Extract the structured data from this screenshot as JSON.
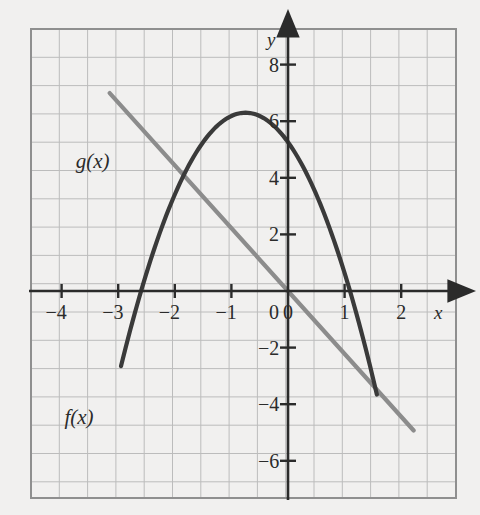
{
  "figure": {
    "background_color": "#f1f0ef",
    "grid_color": "#9a9a9a",
    "grid_minor_color": "#bcbcbc",
    "axis_color": "#2b2b2b",
    "plot_box": {
      "x0": 31,
      "y0": 29,
      "x1": 456,
      "y1": 498,
      "cell_px": 28.3
    }
  },
  "axes": {
    "x_name": "x",
    "y_name": "y",
    "origin_px": {
      "x": 288,
      "y": 291
    },
    "px_per_unit_x": 56.6,
    "px_per_unit_y": 28.3,
    "x_ticks": [
      {
        "value": -4,
        "label": "−4"
      },
      {
        "value": -3,
        "label": "−3"
      },
      {
        "value": -2,
        "label": "−2"
      },
      {
        "value": -1,
        "label": "−1"
      },
      {
        "value": 0,
        "label": "0"
      },
      {
        "value": 1,
        "label": "1"
      },
      {
        "value": 2,
        "label": "2"
      }
    ],
    "y_ticks": [
      {
        "value": 8,
        "label": "8"
      },
      {
        "value": 6,
        "label": "6"
      },
      {
        "value": 4,
        "label": "4"
      },
      {
        "value": 2,
        "label": "2"
      },
      {
        "value": -2,
        "label": "−2"
      },
      {
        "value": -4,
        "label": "−4"
      },
      {
        "value": -6,
        "label": "−6"
      }
    ],
    "x_range": [
      -4.55,
      2.97
    ],
    "y_range": [
      -7.3,
      9.25
    ]
  },
  "curves": {
    "f": {
      "label": "f(x)",
      "color": "#3a3a3a",
      "width_px": 4.2,
      "type": "parabola",
      "vertex": {
        "x": -0.75,
        "y": 6.3
      },
      "a": -1.85,
      "roots": [
        -2.6,
        1.1
      ],
      "domain": [
        -2.95,
        1.58
      ],
      "label_pos": {
        "x": -3.95,
        "y": -4.6
      }
    },
    "g": {
      "label": "g(x)",
      "color": "#8c8c8c",
      "width_px": 4.2,
      "type": "line",
      "slope": -2.22,
      "intercept": 0.0,
      "domain": [
        -3.15,
        2.22
      ],
      "label_pos": {
        "x": -3.75,
        "y": 4.45
      }
    },
    "intersections": [
      {
        "x": -2.0,
        "y": 3.1
      }
    ]
  },
  "chart_data": {
    "type": "line",
    "title": "",
    "xlabel": "x",
    "ylabel": "y",
    "xlim": [
      -4.55,
      2.97
    ],
    "ylim": [
      -7.3,
      9.25
    ],
    "grid": true,
    "legend": "inline-labels",
    "xticks": [
      -4,
      -3,
      -2,
      -1,
      0,
      1,
      2
    ],
    "yticks": [
      8,
      6,
      4,
      2,
      -2,
      -4,
      -6
    ],
    "series": [
      {
        "name": "f(x)",
        "kind": "parabola",
        "color": "#3a3a3a",
        "equation": "y = -1.85(x + 0.75)^2 + 6.3",
        "x": [
          -2.95,
          -2.6,
          -2.0,
          -1.5,
          -1.0,
          -0.75,
          -0.5,
          0.0,
          0.5,
          1.0,
          1.1,
          1.58
        ],
        "y": [
          -2.9,
          0.0,
          3.1,
          5.3,
          6.2,
          6.3,
          6.2,
          5.3,
          3.1,
          0.3,
          0.0,
          -4.9
        ]
      },
      {
        "name": "g(x)",
        "kind": "line",
        "color": "#8c8c8c",
        "equation": "y = -2.22x",
        "x": [
          -3.15,
          -2.0,
          -1.0,
          0.0,
          1.0,
          2.22
        ],
        "y": [
          7.0,
          4.45,
          2.22,
          0.0,
          -2.22,
          -4.93
        ]
      }
    ]
  }
}
